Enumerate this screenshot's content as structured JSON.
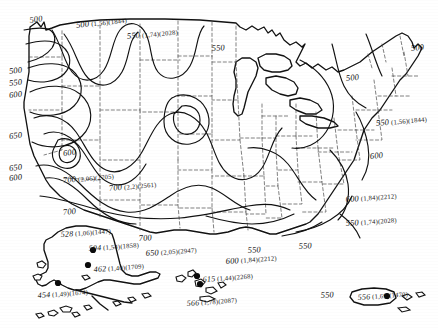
{
  "figure": {
    "kind": "contour-map",
    "region": "United States with Alaska, Hawaii and Puerto Rico insets",
    "contour_interval": 50
  },
  "chart_data": {
    "type": "contour-map",
    "title": "",
    "xlabel": "",
    "ylabel": "",
    "contour_interval": 50,
    "contour_levels": [
      500,
      550,
      600,
      650,
      700
    ],
    "contour_labels": [
      {
        "id": "c01",
        "value": "500",
        "x": 28,
        "y": 10,
        "rot": -8
      },
      {
        "id": "c02",
        "value": "500",
        "x": 75,
        "y": 15,
        "rot": -6,
        "paren1": "(1,56)",
        "paren2": "(1844)"
      },
      {
        "id": "c03",
        "value": "550",
        "x": 126,
        "y": 26,
        "rot": -5,
        "paren1": "(1,74)",
        "paren2": "(2028)"
      },
      {
        "id": "c04",
        "value": "550",
        "x": 211,
        "y": 38,
        "rot": -4
      },
      {
        "id": "c05",
        "value": "500",
        "x": 410,
        "y": 38,
        "rot": -5
      },
      {
        "id": "c06",
        "value": "500",
        "x": 345,
        "y": 68,
        "rot": -5
      },
      {
        "id": "c07",
        "value": "500",
        "x": 8,
        "y": 61,
        "rot": -6
      },
      {
        "id": "c08",
        "value": "550",
        "x": 8,
        "y": 73,
        "rot": -6
      },
      {
        "id": "c09",
        "value": "600",
        "x": 8,
        "y": 85,
        "rot": -6
      },
      {
        "id": "c10",
        "value": "550",
        "x": 375,
        "y": 113,
        "rot": -5,
        "paren1": "(1,56)",
        "paren2": "(1844)"
      },
      {
        "id": "c11",
        "value": "650",
        "x": 8,
        "y": 126,
        "rot": -6
      },
      {
        "id": "c12",
        "value": "600",
        "x": 369,
        "y": 146,
        "rot": -5
      },
      {
        "id": "c13",
        "value": "650",
        "x": 8,
        "y": 158,
        "rot": -6
      },
      {
        "id": "c14",
        "value": "600",
        "x": 8,
        "y": 168,
        "rot": -6
      },
      {
        "id": "c15",
        "value": "600",
        "x": 62,
        "y": 143,
        "rot": -6
      },
      {
        "id": "c16",
        "value": "700",
        "x": 62,
        "y": 170,
        "rot": -5,
        "paren1": "(2,06)",
        "paren2": "(2705)"
      },
      {
        "id": "c17",
        "value": "700",
        "x": 108,
        "y": 178,
        "rot": -5,
        "paren1": "(2,2)",
        "paren2": "(2561)"
      },
      {
        "id": "c18",
        "value": "700",
        "x": 62,
        "y": 202,
        "rot": -5
      },
      {
        "id": "c19",
        "value": "700",
        "x": 138,
        "y": 228,
        "rot": -4
      },
      {
        "id": "c20",
        "value": "650",
        "x": 145,
        "y": 243,
        "rot": -4,
        "paren1": "(2,05)",
        "paren2": "(2947)"
      },
      {
        "id": "c21",
        "value": "600",
        "x": 225,
        "y": 251,
        "rot": -4,
        "paren1": "(1,84)",
        "paren2": "(2212)"
      },
      {
        "id": "c22",
        "value": "550",
        "x": 247,
        "y": 240,
        "rot": -4
      },
      {
        "id": "c23",
        "value": "550",
        "x": 298,
        "y": 236,
        "rot": -4
      },
      {
        "id": "c24",
        "value": "550",
        "x": 345,
        "y": 213,
        "rot": -4,
        "paren1": "(1,74)",
        "paren2": "(2028)"
      },
      {
        "id": "c25",
        "value": "600",
        "x": 345,
        "y": 189,
        "rot": -4,
        "paren1": "(1,84)",
        "paren2": "(2212)"
      },
      {
        "id": "c26",
        "value": "550",
        "x": 320,
        "y": 285,
        "rot": -4
      }
    ],
    "stations": [
      {
        "id": "s1",
        "label": "528",
        "paren1": "(1,06)",
        "paren2": "(1447)",
        "lx": 60,
        "ly": 224,
        "dx": 0,
        "dy": 0,
        "has_dot": false
      },
      {
        "id": "s2",
        "label": "504",
        "paren1": "(1,54)",
        "paren2": "(1858)",
        "lx": 88,
        "ly": 238,
        "dx": 93,
        "dy": 250,
        "has_dot": true
      },
      {
        "id": "s3",
        "label": "462",
        "paren1": "(1,40)",
        "paren2": "(1709)",
        "lx": 93,
        "ly": 259,
        "dx": 88,
        "dy": 265,
        "has_dot": true
      },
      {
        "id": "s4",
        "label": "454",
        "paren1": "(1,49)",
        "paren2": "(1674)",
        "lx": 37,
        "ly": 285,
        "dx": 58,
        "dy": 283,
        "has_dot": true
      },
      {
        "id": "s5",
        "label": "615",
        "paren1": "(1,44)",
        "paren2": "(2268)",
        "lx": 202,
        "ly": 269,
        "dx": 197,
        "dy": 276,
        "has_dot": true
      },
      {
        "id": "s6",
        "label": "566",
        "paren1": "(1,78)",
        "paren2": "(2087)",
        "lx": 186,
        "ly": 293,
        "dx": 200,
        "dy": 284,
        "has_dot": true
      },
      {
        "id": "s7",
        "label": "556",
        "paren1": "(1,69)",
        "paren2": "(1470)",
        "lx": 357,
        "ly": 287,
        "dx": 387,
        "dy": 296,
        "has_dot": true
      }
    ]
  }
}
